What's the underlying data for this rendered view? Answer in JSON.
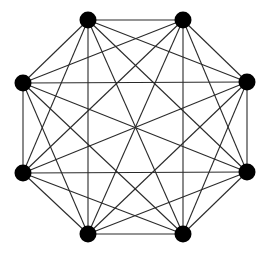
{
  "diagram": {
    "type": "complete-graph",
    "name": "K8",
    "node_count": 8,
    "edge_count": 28,
    "layout": "regular-octagon",
    "node_color": "#000000",
    "edge_color": "#2a2a2a",
    "background": "#ffffff",
    "nodes": [
      {
        "id": "n0",
        "position": "top-left"
      },
      {
        "id": "n1",
        "position": "top-right"
      },
      {
        "id": "n2",
        "position": "right-upper"
      },
      {
        "id": "n3",
        "position": "right-lower"
      },
      {
        "id": "n4",
        "position": "bottom-right"
      },
      {
        "id": "n5",
        "position": "bottom-left"
      },
      {
        "id": "n6",
        "position": "left-lower"
      },
      {
        "id": "n7",
        "position": "left-upper"
      }
    ],
    "edges": "all-pairs"
  }
}
